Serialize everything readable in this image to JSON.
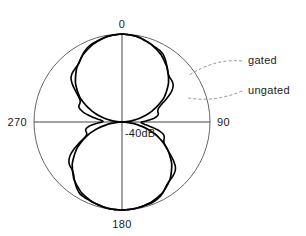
{
  "chart_data": {
    "type": "line",
    "plot_kind": "polar-radiation-pattern",
    "title": "",
    "center_label": "-40dB",
    "center_value_db": -40,
    "outer_value_db": 0,
    "radial_range_db": [
      -40,
      0
    ],
    "grid": {
      "rings": 1,
      "ring_values_db": [
        0
      ],
      "axes_at_deg": [
        0,
        90,
        180,
        270
      ]
    },
    "angle_ticks": [
      {
        "deg": 0,
        "label": "0"
      },
      {
        "deg": 90,
        "label": "90"
      },
      {
        "deg": 180,
        "label": "180"
      },
      {
        "deg": 270,
        "label": "270"
      }
    ],
    "legend": {
      "position": "right-external-callouts",
      "entries": [
        {
          "name": "gated",
          "style": "smooth"
        },
        {
          "name": "ungated",
          "style": "rippled"
        }
      ]
    },
    "annotations": [
      {
        "text": "gated",
        "x": 248,
        "y": 64,
        "anchor_deg": 55,
        "anchor_r_frac": 0.92
      },
      {
        "text": "ungated",
        "x": 248,
        "y": 94,
        "anchor_deg": 70,
        "anchor_r_frac": 0.8
      }
    ],
    "series": [
      {
        "name": "gated",
        "description": "smooth two-lobe pattern, nulls at 90 and 270 degrees",
        "angles_deg": [
          0,
          10,
          20,
          30,
          40,
          50,
          60,
          70,
          75,
          80,
          85,
          88,
          90,
          92,
          95,
          100,
          105,
          110,
          120,
          130,
          140,
          150,
          160,
          170,
          180,
          190,
          200,
          210,
          220,
          230,
          240,
          250,
          255,
          260,
          265,
          268,
          270,
          272,
          275,
          280,
          285,
          290,
          300,
          310,
          320,
          330,
          340,
          350
        ],
        "values_db": [
          0,
          -0.6,
          -2.2,
          -4.6,
          -8.0,
          -12.4,
          -18.0,
          -25.5,
          -29.5,
          -33.5,
          -37.0,
          -39.0,
          -40,
          -39.0,
          -37.0,
          -33.0,
          -28.5,
          -24.0,
          -16.5,
          -10.5,
          -6.0,
          -3.0,
          -1.2,
          -0.3,
          0,
          -0.3,
          -1.2,
          -3.0,
          -6.0,
          -10.5,
          -16.5,
          -24.0,
          -28.5,
          -33.0,
          -37.0,
          -39.0,
          -40,
          -39.0,
          -37.0,
          -33.5,
          -29.5,
          -25.5,
          -18.0,
          -12.4,
          -8.0,
          -4.6,
          -2.2,
          -0.6
        ]
      },
      {
        "name": "ungated",
        "description": "rippled pattern with oscillations about the gated curve, larger ripple near the 90 and 270 degree nulls",
        "ripple_amplitude_db": 2.5,
        "ripple_cycles": 14,
        "angles_deg": [
          0,
          10,
          20,
          30,
          40,
          50,
          60,
          70,
          75,
          80,
          85,
          88,
          90,
          92,
          95,
          100,
          105,
          110,
          120,
          130,
          140,
          150,
          160,
          170,
          180,
          190,
          200,
          210,
          220,
          230,
          240,
          250,
          255,
          260,
          265,
          268,
          270,
          272,
          275,
          280,
          285,
          290,
          300,
          310,
          320,
          330,
          340,
          350
        ],
        "values_db": [
          0,
          -0.5,
          -2.0,
          -4.2,
          -7.2,
          -11.0,
          -15.5,
          -20.5,
          -23.5,
          -26.0,
          -28.0,
          -29.0,
          -29.5,
          -29.0,
          -28.0,
          -26.0,
          -23.5,
          -21.0,
          -15.0,
          -9.5,
          -5.4,
          -2.6,
          -1.0,
          -0.2,
          0,
          -0.2,
          -1.0,
          -2.6,
          -5.4,
          -9.5,
          -15.0,
          -21.0,
          -23.5,
          -26.0,
          -28.0,
          -29.0,
          -29.5,
          -29.0,
          -28.0,
          -26.0,
          -23.5,
          -20.5,
          -15.5,
          -11.0,
          -7.2,
          -4.2,
          -2.0,
          -0.5
        ]
      }
    ],
    "xlabel": "",
    "ylabel": ""
  },
  "geometry": {
    "cx": 122,
    "cy": 122,
    "r": 88
  }
}
